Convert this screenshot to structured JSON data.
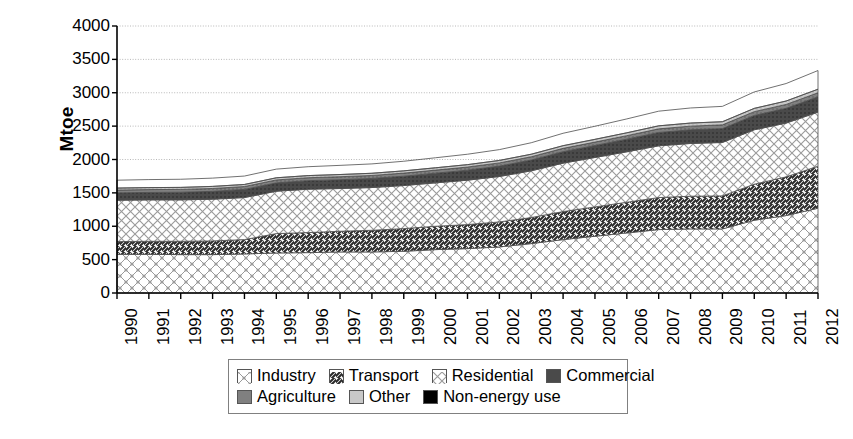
{
  "chart_data": {
    "type": "area",
    "title": "",
    "subtitle": "",
    "xlabel": "",
    "ylabel": "Mtoe",
    "ylim": [
      0,
      4000
    ],
    "ytick_step": 500,
    "yticks": [
      "4000",
      "3500",
      "3000",
      "2500",
      "2000",
      "1500",
      "1000",
      "500",
      "0"
    ],
    "grid": true,
    "grid_style": "dotted-horizontal",
    "legend_position": "bottom",
    "stacked": true,
    "categories": [
      "1990",
      "1991",
      "1992",
      "1993",
      "1994",
      "1995",
      "1996",
      "1997",
      "1998",
      "1999",
      "2000",
      "2001",
      "2002",
      "2003",
      "2004",
      "2005",
      "2006",
      "2007",
      "2008",
      "2009",
      "2010",
      "2011",
      "2012"
    ],
    "series": [
      {
        "name": "Industry",
        "pattern": "diagonal-cross-dotted",
        "color": "#e8e8e8",
        "values": [
          580,
          580,
          575,
          575,
          585,
          600,
          605,
          615,
          615,
          625,
          650,
          665,
          690,
          740,
          800,
          850,
          900,
          950,
          960,
          960,
          1090,
          1160,
          1270
        ]
      },
      {
        "name": "Transport",
        "pattern": "diagonal-lines",
        "color": "#bdbdbd",
        "values": [
          190,
          195,
          200,
          205,
          215,
          290,
          300,
          310,
          325,
          340,
          350,
          360,
          375,
          390,
          420,
          440,
          460,
          480,
          490,
          495,
          540,
          580,
          630
        ]
      },
      {
        "name": "Residential",
        "pattern": "cross-hatch",
        "color": "#f0f0f0",
        "values": [
          620,
          620,
          620,
          625,
          630,
          635,
          650,
          640,
          640,
          645,
          650,
          665,
          680,
          700,
          725,
          740,
          755,
          775,
          790,
          800,
          815,
          805,
          810
        ]
      },
      {
        "name": "Commercial",
        "pattern": "solid",
        "color": "#4a4a4a",
        "values": [
          110,
          112,
          115,
          118,
          122,
          125,
          128,
          132,
          136,
          140,
          145,
          150,
          156,
          162,
          172,
          180,
          190,
          200,
          205,
          208,
          215,
          222,
          230
        ]
      },
      {
        "name": "Agriculture",
        "pattern": "solid",
        "color": "#808080",
        "values": [
          42,
          42,
          42,
          43,
          43,
          44,
          44,
          45,
          45,
          46,
          46,
          47,
          48,
          49,
          50,
          51,
          52,
          54,
          55,
          56,
          57,
          58,
          60
        ]
      },
      {
        "name": "Other",
        "pattern": "solid",
        "color": "#c8c8c8",
        "values": [
          30,
          30,
          30,
          31,
          31,
          32,
          32,
          33,
          33,
          34,
          35,
          36,
          37,
          38,
          40,
          41,
          43,
          45,
          46,
          47,
          49,
          51,
          53
        ]
      },
      {
        "name": "Non-energy use",
        "pattern": "solid",
        "color": "#000000",
        "values": [
          118,
          120,
          122,
          124,
          126,
          130,
          133,
          137,
          140,
          144,
          150,
          156,
          162,
          172,
          186,
          196,
          208,
          220,
          226,
          230,
          246,
          262,
          280
        ]
      }
    ]
  },
  "axis": {
    "y_title": "Mtoe"
  },
  "legend": {
    "rows": [
      [
        {
          "label": "Industry",
          "key": "industry"
        },
        {
          "label": "Transport",
          "key": "transport"
        },
        {
          "label": "Residential",
          "key": "residential"
        },
        {
          "label": "Commercial",
          "key": "commercial"
        }
      ],
      [
        {
          "label": "Agriculture",
          "key": "agriculture"
        },
        {
          "label": "Other",
          "key": "other"
        },
        {
          "label": "Non-energy use",
          "key": "nonenergy"
        }
      ]
    ]
  }
}
